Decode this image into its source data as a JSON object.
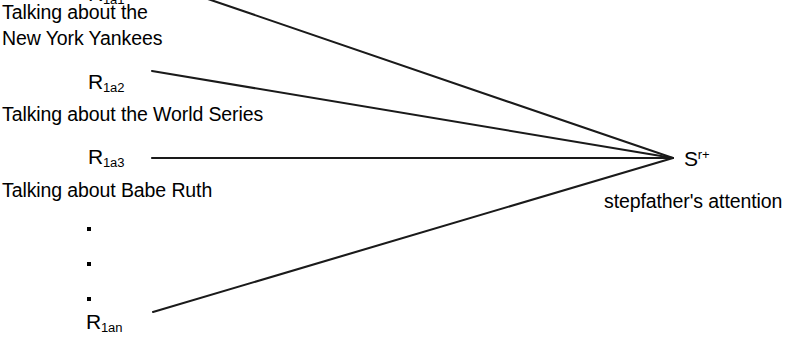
{
  "diagram": {
    "type": "stimulus-response-fan",
    "canvas": {
      "width": 806,
      "height": 349,
      "background": "#ffffff"
    },
    "line_color": "#1a1a1a",
    "text_color": "#000000",
    "convergence_point": {
      "x": 673,
      "y": 158
    },
    "responses": [
      {
        "id": "r1a1",
        "label_r": "R",
        "label_sub": "1a1",
        "description": "Talking about the\nNew York Yankees",
        "description_line1": "Talking about the",
        "description_line2": "New York Yankees",
        "line_start": {
          "x": 205,
          "y": -2
        }
      },
      {
        "id": "r1a2",
        "label_r": "R",
        "label_sub": "1a2",
        "description": "Talking about the World Series",
        "description_line1": "Talking about the World Series",
        "description_line2": "",
        "line_start": {
          "x": 152,
          "y": 71
        }
      },
      {
        "id": "r1a3",
        "label_r": "R",
        "label_sub": "1a3",
        "description": "Talking about Babe Ruth",
        "description_line1": "Talking about Babe Ruth",
        "description_line2": "",
        "line_start": {
          "x": 152,
          "y": 158
        }
      },
      {
        "id": "r1an",
        "label_r": "R",
        "label_sub": "1an",
        "description": "",
        "description_line1": "",
        "description_line2": "",
        "line_start": {
          "x": 153,
          "y": 312
        }
      }
    ],
    "ellipsis": {
      "count": 3,
      "dots": [
        {
          "x": 89,
          "y": 229
        },
        {
          "x": 89,
          "y": 264
        },
        {
          "x": 89,
          "y": 299
        }
      ]
    },
    "stimulus": {
      "label_s": "S",
      "label_sup": "r+",
      "description": "stepfather's attention"
    }
  }
}
